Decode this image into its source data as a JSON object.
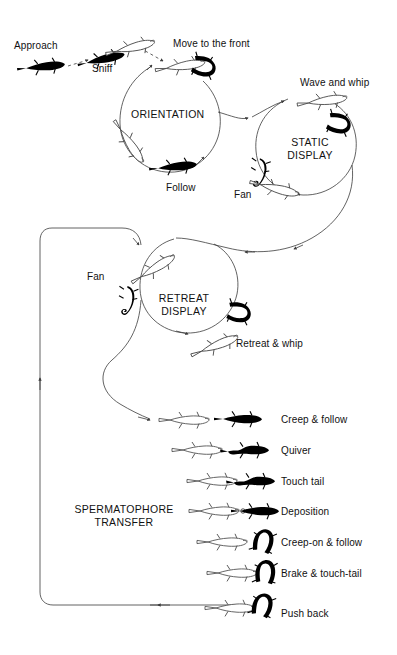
{
  "figure": {
    "kind": "ethogram-flow-diagram",
    "background_color": "#ffffff",
    "line_color": "#3b3b3b",
    "text_color": "#111111",
    "male_color": "#000000",
    "female_color": "#ffffff"
  },
  "phases": [
    {
      "id": "orientation",
      "label": "ORIENTATION"
    },
    {
      "id": "static_display",
      "label": "STATIC\nDISPLAY",
      "line1": "STATIC",
      "line2": "DISPLAY"
    },
    {
      "id": "retreat_display",
      "label": "RETREAT\nDISPLAY",
      "line1": "RETREAT",
      "line2": "DISPLAY"
    },
    {
      "id": "spermatophore_transfer",
      "label": "SPERMATOPHORE\nTRANSFER",
      "line1": "SPERMATOPHORE",
      "line2": "TRANSFER"
    }
  ],
  "intro_steps": [
    {
      "id": "approach",
      "label": "Approach"
    },
    {
      "id": "sniff",
      "label": "Sniff"
    },
    {
      "id": "move_to_the_front",
      "label": "Move to the front"
    }
  ],
  "orientation_steps": [
    {
      "id": "follow",
      "label": "Follow"
    }
  ],
  "static_display_steps": [
    {
      "id": "wave_and_whip",
      "label": "Wave and whip"
    },
    {
      "id": "fan_static",
      "label": "Fan"
    }
  ],
  "retreat_display_steps": [
    {
      "id": "fan_retreat",
      "label": "Fan"
    },
    {
      "id": "retreat_and_whip",
      "label": "Retreat & whip"
    }
  ],
  "spermatophore_steps": [
    {
      "id": "creep_and_follow",
      "label": "Creep & follow"
    },
    {
      "id": "quiver",
      "label": "Quiver"
    },
    {
      "id": "touch_tail",
      "label": "Touch tail"
    },
    {
      "id": "deposition",
      "label": "Deposition"
    },
    {
      "id": "creep_on_and_follow",
      "label": "Creep-on & follow"
    },
    {
      "id": "brake_and_touch_tail",
      "label": "Brake & touch-tail"
    },
    {
      "id": "push_back",
      "label": "Push back"
    }
  ]
}
